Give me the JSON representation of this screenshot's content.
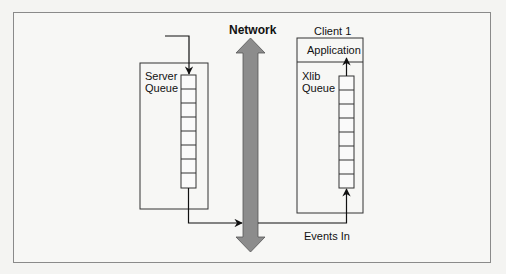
{
  "diagram": {
    "title": "",
    "network": {
      "label": "Network",
      "color": "#8c8c8c"
    },
    "server": {
      "label_line1": "Server",
      "label_line2": "Queue",
      "cells": 8
    },
    "client": {
      "title": "Client 1",
      "application_label": "Application",
      "queue_label_line1": "Xlib",
      "queue_label_line2": "Queue",
      "cells": 8
    },
    "events_label": "Events In",
    "edges": [
      {
        "from": "external",
        "to": "server-queue"
      },
      {
        "from": "server-queue",
        "to": "network",
        "label": ""
      },
      {
        "from": "network",
        "to": "xlib-queue",
        "label": "Events In"
      },
      {
        "from": "xlib-queue",
        "to": "application"
      }
    ]
  }
}
